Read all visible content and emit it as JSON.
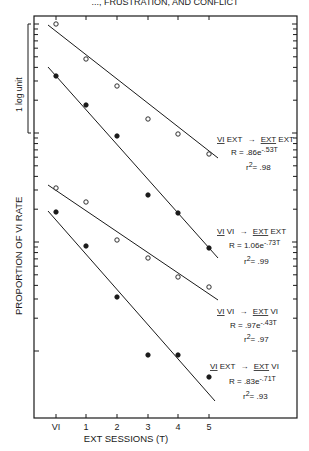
{
  "header": {
    "text": "..., FRUSTRATION, AND CONFLICT"
  },
  "chart_data": {
    "type": "line",
    "title": "",
    "xlabel": "EXT SESSIONS (T)",
    "ylabel": "PROPORTION OF VI RATE",
    "yscale": "log",
    "scale_bar_label": "1 log unit",
    "categories": [
      "VI",
      "1",
      "2",
      "3",
      "4",
      "5"
    ],
    "x": [
      0,
      1,
      2,
      3,
      4,
      5
    ],
    "series": [
      {
        "name": "VI EXT → EXT EXT",
        "condition_pre": "VI EXT",
        "condition_post": "EXT EXT",
        "marker": "open",
        "equation": "R = .86e-.53T",
        "equation_base": "R = .86e",
        "equation_exp": "-.53T",
        "r2": "r2 = .98",
        "r2_value": ".98",
        "values": [
          1.0,
          0.48,
          0.27,
          0.14,
          0.1,
          0.066
        ],
        "px": [
          [
            56,
            24
          ],
          [
            86,
            59
          ],
          [
            117,
            86
          ],
          [
            148,
            119
          ],
          [
            178,
            134
          ],
          [
            209,
            154
          ]
        ],
        "fit": [
          [
            48,
            25
          ],
          [
            218,
            158
          ]
        ]
      },
      {
        "name": "VI VI → EXT EXT",
        "condition_pre": "VI VI",
        "condition_post": "EXT EXT",
        "marker": "filled",
        "equation": "R = 1.06e-.73T",
        "equation_base": "R = 1.06e",
        "equation_exp": "-.73T",
        "r2": "r2 = .99",
        "r2_value": ".99",
        "values": [
          0.33,
          0.18,
          0.092,
          0.026,
          0.018,
          0.0085
        ],
        "px": [
          [
            56,
            76
          ],
          [
            86,
            105
          ],
          [
            117,
            136
          ],
          [
            148,
            195
          ],
          [
            178,
            213
          ],
          [
            209,
            248
          ]
        ],
        "fit": [
          [
            48,
            67
          ],
          [
            218,
            258
          ]
        ]
      },
      {
        "name": "VI VI → EXT VI",
        "condition_pre": "VI VI",
        "condition_post": "EXT VI",
        "marker": "open",
        "equation": "R = .97e-.43T",
        "equation_base": "R = .97e",
        "equation_exp": "-.43T",
        "r2": "r2 = .97",
        "r2_value": ".97",
        "values": [
          1.0,
          0.74,
          0.33,
          0.22,
          0.15,
          0.12
        ],
        "px": [
          [
            56,
            188
          ],
          [
            86,
            202
          ],
          [
            117,
            240
          ],
          [
            148,
            258
          ],
          [
            178,
            277
          ],
          [
            209,
            287
          ]
        ],
        "fit": [
          [
            48,
            185
          ],
          [
            218,
            300
          ]
        ]
      },
      {
        "name": "VI EXT → EXT VI",
        "condition_pre": "VI EXT",
        "condition_post": "EXT VI",
        "marker": "filled",
        "equation": "R = .83e-.71T",
        "equation_base": "R = .83e",
        "equation_exp": "-.71T",
        "r2": "r2 = .93",
        "r2_value": ".93",
        "values": [
          0.6,
          0.29,
          0.098,
          0.029,
          0.029,
          0.018
        ],
        "px": [
          [
            56,
            212
          ],
          [
            86,
            246
          ],
          [
            117,
            297
          ],
          [
            148,
            355
          ],
          [
            178,
            355
          ],
          [
            209,
            377
          ]
        ],
        "fit": [
          [
            48,
            211
          ],
          [
            215,
            401
          ]
        ]
      }
    ],
    "grid": false,
    "legend_position": "inline-right"
  },
  "labels": {
    "x_ticks": [
      "VI",
      "1",
      "2",
      "3",
      "4",
      "5"
    ],
    "xlabel": "EXT SESSIONS (T)",
    "ylabel": "PROPORTION OF VI RATE",
    "scale_bar": "1 log unit",
    "s0": {
      "pre_u": "VI",
      "pre_rest": " EXT",
      "arrow": "→",
      "post_u": "EXT",
      "post_rest": " EXT",
      "eq_base": "R = .86e",
      "eq_exp": "-.53T",
      "r2_base": "r",
      "r2_sup": "2",
      "r2_val": "= .98"
    },
    "s1": {
      "pre_u": "VI",
      "pre_rest": " VI",
      "arrow": "→",
      "post_u": "EXT",
      "post_rest": " EXT",
      "eq_base": "R = 1.06e",
      "eq_exp": "-.73T",
      "r2_base": "r",
      "r2_sup": "2",
      "r2_val": "= .99"
    },
    "s2": {
      "pre_u": "VI",
      "pre_rest": " VI",
      "arrow": "→",
      "post_u": "EXT",
      "post_rest": " VI",
      "eq_base": "R = .97e",
      "eq_exp": "-.43T",
      "r2_base": "r",
      "r2_sup": "2",
      "r2_val": "= .97"
    },
    "s3": {
      "pre_u": "VI",
      "pre_rest": " EXT",
      "arrow": "→",
      "post_u": "EXT",
      "post_rest": " VI",
      "eq_base": "R = .83e",
      "eq_exp": "-.71T",
      "r2_base": "r",
      "r2_sup": "2",
      "r2_val": "= .93"
    }
  }
}
